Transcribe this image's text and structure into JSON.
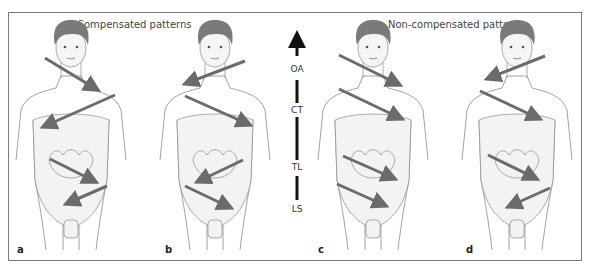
{
  "figure": {
    "groups": [
      {
        "title": "Compensated patterns"
      },
      {
        "title": "Non-compensated patterns"
      }
    ],
    "panels": [
      {
        "label": "a",
        "arrows": [
          "right-down",
          "left-down",
          "right-down",
          "left-down"
        ]
      },
      {
        "label": "b",
        "arrows": [
          "left-down",
          "right-down",
          "left-down",
          "right-down"
        ]
      },
      {
        "label": "c",
        "arrows": [
          "right-down",
          "right-down",
          "right-down",
          "right-down"
        ]
      },
      {
        "label": "d",
        "arrows": [
          "left-down",
          "right-down",
          "right-down",
          "left-down"
        ]
      }
    ],
    "spine_levels": [
      "OA",
      "CT",
      "TL",
      "LS"
    ],
    "colors": {
      "arrow": "#6b6b6b",
      "hair": "#7a7a7a",
      "skin": "#f2f2f2",
      "outline": "#8a8a8a",
      "frame": "#7a7a7a"
    }
  }
}
